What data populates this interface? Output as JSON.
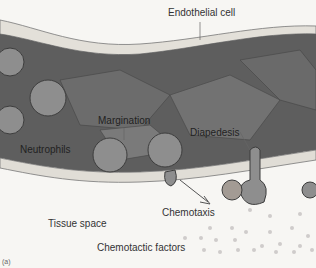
{
  "figure": {
    "labels": {
      "endothelial_cell": "Endothelial cell",
      "margination": "Margination",
      "diapedesis": "Diapedesis",
      "neutrophils": "Neutrophils",
      "chemotaxis": "Chemotaxis",
      "tissue_space": "Tissue space",
      "chemotactic_factors": "Chemotactic factors"
    },
    "panel_label": "(a)"
  },
  "colors": {
    "vessel_lumen": "#5a5a5a",
    "endothelium": "#d9d6cf",
    "tissue": "#f3f2ee",
    "cell": "#8a8a8a",
    "text": "#333333"
  }
}
